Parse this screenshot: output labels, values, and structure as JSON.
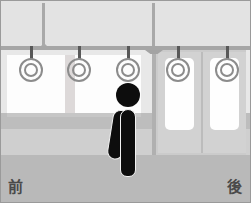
{
  "scene": {
    "title": "Train car interior with standing passenger",
    "width": 251,
    "height": 203
  },
  "labels": {
    "front": "前",
    "rear": "後"
  },
  "straps": [
    {
      "id": "strap-1",
      "x": 30
    },
    {
      "id": "strap-2",
      "x": 78
    },
    {
      "id": "strap-3",
      "x": 127
    },
    {
      "id": "strap-4",
      "x": 177
    },
    {
      "id": "strap-5",
      "x": 226
    }
  ],
  "colors": {
    "ceiling": "#e3e3e3",
    "upper_wall": "#e8e8e8",
    "mid_band": "#bdbdbd",
    "lower_wall": "#cfcfcf",
    "floor": "#b9b9b9",
    "window_glass": "#fdfdfd",
    "door_panel": "#d2d2d2",
    "door_frame": "#cbcbcb",
    "rail": "#a6a6a6",
    "strap_ring": "#8c8c8c",
    "strap_stem": "#585858",
    "person": "#0d0d0d",
    "person_outline": "#f2f2f2",
    "border": "#9a9a9a",
    "label_text": "#4a4a4a"
  }
}
